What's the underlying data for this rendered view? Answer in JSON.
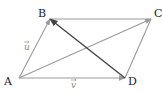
{
  "diagram": {
    "type": "vector-parallelogram",
    "points": [
      {
        "id": "A",
        "label": "A",
        "x": 19,
        "y": 78,
        "lx": 4,
        "ly": 85
      },
      {
        "id": "B",
        "label": "B",
        "x": 50,
        "y": 19,
        "lx": 38,
        "ly": 17
      },
      {
        "id": "C",
        "label": "C",
        "x": 151,
        "y": 19,
        "lx": 154,
        "ly": 17
      },
      {
        "id": "D",
        "label": "D",
        "x": 125,
        "y": 78,
        "lx": 128,
        "ly": 85
      }
    ],
    "vectors": [
      {
        "name": "vector-AB",
        "from": "A",
        "to": "B",
        "color": "#9a9a9a",
        "label": "u"
      },
      {
        "name": "vector-AD",
        "from": "A",
        "to": "D",
        "color": "#9a9a9a",
        "label": "v"
      },
      {
        "name": "vector-AC",
        "from": "A",
        "to": "C",
        "color": "#9a9a9a"
      },
      {
        "name": "vector-DB",
        "from": "D",
        "to": "B",
        "color": "#444444"
      }
    ],
    "segments": [
      {
        "name": "segment-BC",
        "from": "B",
        "to": "C",
        "color": "#9a9a9a"
      },
      {
        "name": "segment-DC",
        "from": "D",
        "to": "C",
        "color": "#9a9a9a"
      }
    ],
    "vector_labels": [
      {
        "text": "u",
        "x": 24,
        "y": 50
      },
      {
        "text": "v",
        "x": 71,
        "y": 88
      }
    ]
  }
}
